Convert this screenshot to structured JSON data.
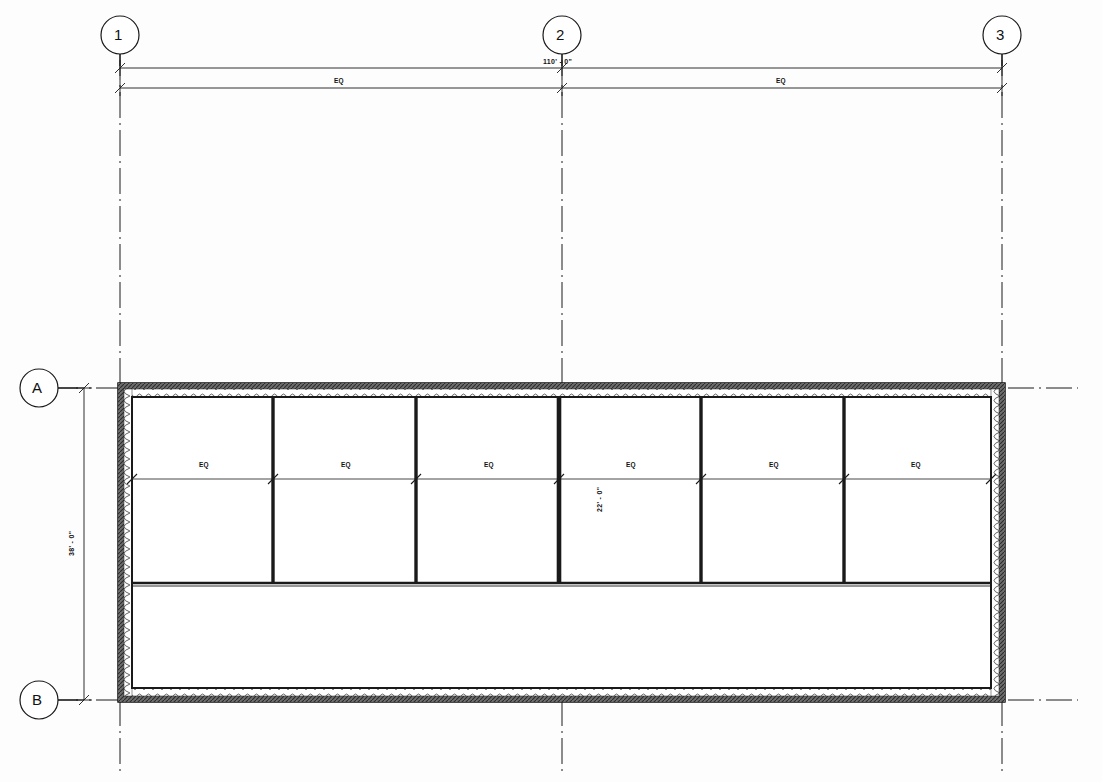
{
  "drawing": {
    "title": "Architectural Floor Plan",
    "background_color": "#fdfdfd",
    "line_color": "#1a1a1a",
    "hatch_color": "#333333"
  },
  "grid_bubbles_vertical": [
    {
      "label": "1",
      "cx": 120,
      "cy": 35,
      "r": 19,
      "line_x": 120,
      "line_top": 54,
      "line_bottom": 775
    },
    {
      "label": "2",
      "cx": 562,
      "cy": 35,
      "r": 19,
      "line_x": 562,
      "line_top": 54,
      "line_bottom": 775
    },
    {
      "label": "3",
      "cx": 1002,
      "cy": 35,
      "r": 19,
      "line_x": 1002,
      "line_top": 54,
      "line_bottom": 775
    }
  ],
  "grid_bubbles_horizontal": [
    {
      "label": "A",
      "cx": 39,
      "cy": 388,
      "r": 19,
      "line_y": 388,
      "line_left": 58,
      "line_right": 1075
    },
    {
      "label": "B",
      "cx": 39,
      "cy": 700,
      "r": 19,
      "line_y": 700,
      "line_left": 58,
      "line_right": 1075
    }
  ],
  "dimensions": {
    "overall_width": {
      "text": "110' - 0\"",
      "x": 543,
      "y": 61,
      "chain_y": 68
    },
    "overall_height": {
      "text": "38' - 0\"",
      "x": 72,
      "y": 544,
      "chain_x": 84
    },
    "interior_bay_depth": {
      "text": "22' - 0\"",
      "x": 598,
      "y": 495,
      "chain_x": 584
    },
    "equal_top": [
      {
        "text": "EQ",
        "x": 337,
        "y": 80
      },
      {
        "text": "EQ",
        "x": 779,
        "y": 80
      }
    ],
    "equal_rooms": [
      {
        "text": "EQ",
        "x": 203,
        "y": 465
      },
      {
        "text": "EQ",
        "x": 345,
        "y": 465
      },
      {
        "text": "EQ",
        "x": 487,
        "y": 465
      },
      {
        "text": "EQ",
        "x": 630,
        "y": 465
      },
      {
        "text": "EQ",
        "x": 772,
        "y": 465
      },
      {
        "text": "EQ",
        "x": 914,
        "y": 465
      }
    ]
  },
  "building": {
    "outer": {
      "x": 118,
      "y": 383,
      "w": 887,
      "h": 319
    },
    "wall_thickness_outer": 6,
    "wall_cavity": 8,
    "inner": {
      "x": 132,
      "y": 397,
      "w": 859,
      "h": 291
    },
    "upper_zone": {
      "y": 397,
      "h": 186
    },
    "corridor": {
      "y": 583,
      "h": 105
    },
    "partitions_x": [
      273,
      416,
      559,
      701,
      844
    ],
    "mid_line_y": 479
  },
  "labels": {
    "plan_note": ""
  }
}
